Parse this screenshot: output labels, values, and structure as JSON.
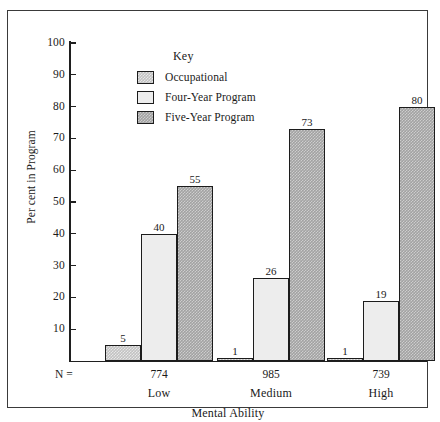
{
  "chart_data": {
    "type": "bar",
    "title": "",
    "xlabel": "Mental Ability",
    "ylabel": "Per cent in Program",
    "categories": [
      "Low",
      "Medium",
      "High"
    ],
    "series": [
      {
        "name": "Occupational",
        "values": [
          5,
          1,
          1
        ],
        "swatch": "light-checkered"
      },
      {
        "name": "Four-Year Program",
        "values": [
          40,
          26,
          19
        ],
        "swatch": "white"
      },
      {
        "name": "Five-Year Program",
        "values": [
          55,
          73,
          80
        ],
        "swatch": "dark-checkered"
      }
    ],
    "group_n": [
      "774",
      "985",
      "739"
    ],
    "n_prefix": "N =",
    "ylim": [
      0,
      100
    ],
    "yticks": [
      10,
      20,
      30,
      40,
      50,
      60,
      70,
      80,
      90,
      100
    ],
    "grid": false,
    "legend_position": "inside-top-center",
    "legend_title": "Key",
    "colors": {
      "occupational": "#c2c2c2",
      "four_year": "#ededed",
      "five_year": "#a2a2a2",
      "outline": "#1c1c1c",
      "text": "#1a1a1a",
      "frame": "#3a3a3a"
    }
  }
}
